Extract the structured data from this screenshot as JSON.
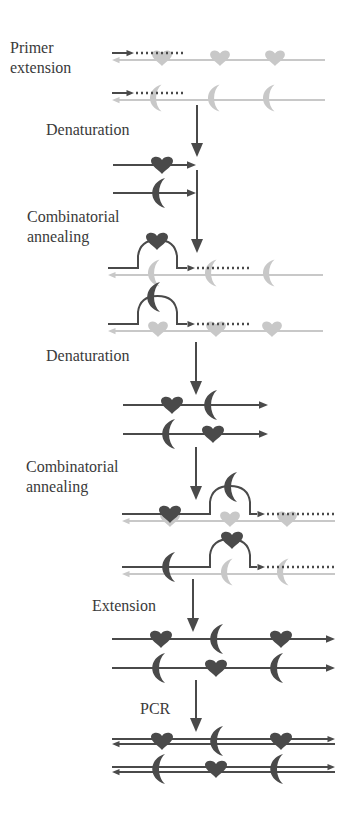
{
  "colors": {
    "dark": "#4a4a4a",
    "light": "#c8c8c8",
    "text": "#3a3a3a"
  },
  "labels": [
    {
      "id": "primer-extension",
      "text": "Primer\nextension",
      "x": 10,
      "y": 48
    },
    {
      "id": "denaturation-1",
      "text": "Denaturation",
      "x": 46,
      "y": 120
    },
    {
      "id": "combinatorial-annealing-1",
      "text": "Combinatorial\nannealing",
      "x": 27,
      "y": 207
    },
    {
      "id": "denaturation-2",
      "text": "Denaturation",
      "x": 46,
      "y": 346
    },
    {
      "id": "combinatorial-annealing-2",
      "text": "Combinatorial\nannealing",
      "x": 26,
      "y": 457
    },
    {
      "id": "extension",
      "text": "Extension",
      "x": 92,
      "y": 596
    },
    {
      "id": "pcr",
      "text": "PCR",
      "x": 140,
      "y": 699
    }
  ],
  "step_arrows": [
    {
      "x": 197,
      "y1": 105,
      "y2": 157
    },
    {
      "x": 197,
      "y1": 170,
      "y2": 253
    },
    {
      "x": 196,
      "y1": 342,
      "y2": 395
    },
    {
      "x": 196,
      "y1": 447,
      "y2": 500
    },
    {
      "x": 193,
      "y1": 579,
      "y2": 632
    },
    {
      "x": 196,
      "y1": 680,
      "y2": 732
    }
  ],
  "rows": [
    {
      "id": "template-heart",
      "y": 53,
      "template": {
        "x1": 112,
        "x2": 325,
        "motifs": [
          {
            "type": "heart",
            "x": 162
          },
          {
            "type": "heart",
            "x": 220
          },
          {
            "type": "heart",
            "x": 275
          }
        ]
      },
      "primer": {
        "x1": 112,
        "x2": 130,
        "dots_to": 185
      }
    },
    {
      "id": "template-moon",
      "y": 93,
      "template": {
        "x1": 112,
        "x2": 325,
        "motifs": [
          {
            "type": "moon",
            "x": 157
          },
          {
            "type": "moon",
            "x": 215
          },
          {
            "type": "moon",
            "x": 270
          }
        ]
      },
      "primer": {
        "x1": 112,
        "x2": 130,
        "dots_to": 185
      }
    },
    {
      "id": "ss-heart",
      "y": 165,
      "strand": {
        "x1": 113,
        "x2": 196,
        "motifs": [
          {
            "type": "heart",
            "x": 162
          }
        ]
      }
    },
    {
      "id": "ss-moon",
      "y": 193,
      "strand": {
        "x1": 113,
        "x2": 196,
        "motifs": [
          {
            "type": "moon",
            "x": 160
          }
        ]
      }
    },
    {
      "id": "anneal1-a",
      "y": 268,
      "template": {
        "x1": 108,
        "x2": 323,
        "motifs": [
          {
            "type": "moon",
            "x": 155
          },
          {
            "type": "moon",
            "x": 212
          },
          {
            "type": "moon",
            "x": 270
          }
        ]
      },
      "looped": {
        "x1": 108,
        "loop_start": 138,
        "loop_end": 177,
        "arrow_x": 195,
        "dots_to": 252,
        "loop_motif": {
          "type": "heart",
          "x": 157
        }
      }
    },
    {
      "id": "anneal1-b",
      "y": 324,
      "template": {
        "x1": 108,
        "x2": 323,
        "motifs": [
          {
            "type": "heart",
            "x": 158
          },
          {
            "type": "heart",
            "x": 216
          },
          {
            "type": "heart",
            "x": 272
          }
        ]
      },
      "looped": {
        "x1": 108,
        "loop_start": 138,
        "loop_end": 177,
        "arrow_x": 195,
        "dots_to": 252,
        "loop_motif": {
          "type": "moon",
          "x": 155
        }
      }
    },
    {
      "id": "ss2-a",
      "y": 405,
      "strand": {
        "x1": 123,
        "x2": 268,
        "motifs": [
          {
            "type": "heart",
            "x": 172
          },
          {
            "type": "moon",
            "x": 212
          }
        ]
      }
    },
    {
      "id": "ss2-b",
      "y": 434,
      "strand": {
        "x1": 123,
        "x2": 268,
        "motifs": [
          {
            "type": "moon",
            "x": 170
          },
          {
            "type": "heart",
            "x": 213
          }
        ]
      }
    },
    {
      "id": "anneal2-a",
      "y": 514,
      "template": {
        "x1": 122,
        "x2": 335,
        "motifs": [
          {
            "type": "heart",
            "x": 170
          },
          {
            "type": "heart",
            "x": 230
          },
          {
            "type": "heart",
            "x": 287
          }
        ]
      },
      "looped": {
        "x1": 122,
        "pre_motif": {
          "type": "heart",
          "x": 170
        },
        "loop_start": 210,
        "loop_end": 250,
        "arrow_x": 265,
        "dots_to": 335,
        "loop_motif": {
          "type": "moon",
          "x": 232
        }
      }
    },
    {
      "id": "anneal2-b",
      "y": 567,
      "template": {
        "x1": 122,
        "x2": 335,
        "motifs": [
          {
            "type": "moon",
            "x": 228
          },
          {
            "type": "moon",
            "x": 284
          }
        ]
      },
      "looped": {
        "x1": 122,
        "pre_motif": {
          "type": "moon",
          "x": 170
        },
        "loop_start": 210,
        "loop_end": 250,
        "arrow_x": 265,
        "dots_to": 335,
        "loop_motif": {
          "type": "heart",
          "x": 232
        }
      }
    },
    {
      "id": "ext-a",
      "y": 639,
      "strand": {
        "x1": 112,
        "x2": 335,
        "motifs": [
          {
            "type": "heart",
            "x": 161
          },
          {
            "type": "moon",
            "x": 218
          },
          {
            "type": "heart",
            "x": 281
          }
        ]
      }
    },
    {
      "id": "ext-b",
      "y": 668,
      "strand": {
        "x1": 112,
        "x2": 335,
        "motifs": [
          {
            "type": "moon",
            "x": 160
          },
          {
            "type": "heart",
            "x": 216
          },
          {
            "type": "moon",
            "x": 278
          }
        ]
      }
    },
    {
      "id": "pcr-a",
      "y": 741,
      "duplex": {
        "x1": 112,
        "x2": 335,
        "motifs": [
          {
            "type": "heart",
            "x": 162
          },
          {
            "type": "moon",
            "x": 218
          },
          {
            "type": "heart",
            "x": 281
          }
        ]
      }
    },
    {
      "id": "pcr-b",
      "y": 769,
      "duplex": {
        "x1": 112,
        "x2": 335,
        "motifs": [
          {
            "type": "moon",
            "x": 160
          },
          {
            "type": "heart",
            "x": 216
          },
          {
            "type": "moon",
            "x": 278
          }
        ]
      }
    }
  ]
}
